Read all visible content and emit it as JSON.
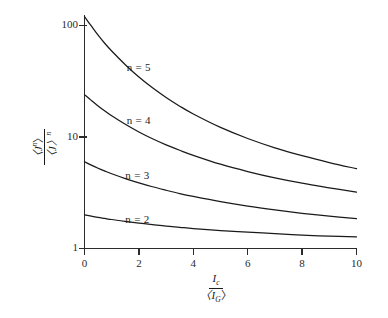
{
  "chart_data": {
    "type": "line",
    "title": "",
    "subtitle": "",
    "xlabel": "I_c / <I_G>",
    "ylabel": "<J^n> / <J>^n",
    "xlabel_parts": {
      "numerator": "I",
      "numerator_sub": "c",
      "denominator": "〈I",
      "denominator_sub": "G",
      "denominator_close": "〉"
    },
    "ylabel_parts": {
      "numerator": "〈J",
      "numerator_sup": "n",
      "numerator_close": "〉",
      "denominator": "〈J〉",
      "denominator_sup": "n"
    },
    "xscale": "linear",
    "yscale": "log",
    "xlim": [
      0,
      10
    ],
    "ylim": [
      1,
      140
    ],
    "grid": false,
    "legend": "inline-curve-labels",
    "xticks": [
      0,
      2,
      4,
      6,
      8,
      10
    ],
    "xtick_labels": [
      "0",
      "2",
      "4",
      "6",
      "8",
      "10"
    ],
    "yticks": [
      1,
      10,
      100
    ],
    "ytick_labels": [
      "1",
      "10",
      "100"
    ],
    "x": [
      0,
      0.25,
      0.5,
      0.75,
      1,
      1.5,
      2,
      2.5,
      3,
      3.5,
      4,
      5,
      6,
      7,
      8,
      9,
      10
    ],
    "series": [
      {
        "name": "n = 5",
        "label": "n = 5",
        "label_x": 1.55,
        "label_y": 42.0,
        "values": [
          120.0,
          99.0,
          82.0,
          69.0,
          59.0,
          44.5,
          34.5,
          27.6,
          22.6,
          18.9,
          16.1,
          12.2,
          9.7,
          8.0,
          6.8,
          5.9,
          5.2
        ]
      },
      {
        "name": "n = 4",
        "label": "n = 4",
        "label_x": 1.55,
        "label_y": 13.8,
        "values": [
          24.0,
          21.3,
          19.0,
          17.1,
          15.5,
          13.0,
          11.1,
          9.65,
          8.5,
          7.6,
          6.85,
          5.7,
          4.9,
          4.3,
          3.85,
          3.5,
          3.2
        ]
      },
      {
        "name": "n = 3",
        "label": "n = 3",
        "label_x": 1.5,
        "label_y": 4.45,
        "values": [
          6.0,
          5.6,
          5.25,
          4.95,
          4.68,
          4.24,
          3.88,
          3.58,
          3.33,
          3.11,
          2.93,
          2.63,
          2.4,
          2.22,
          2.07,
          1.95,
          1.85
        ]
      },
      {
        "name": "n = 2",
        "label": "n = 2",
        "label_x": 1.5,
        "label_y": 1.82,
        "values": [
          2.0,
          1.95,
          1.9,
          1.86,
          1.82,
          1.75,
          1.69,
          1.64,
          1.59,
          1.55,
          1.51,
          1.45,
          1.4,
          1.36,
          1.32,
          1.29,
          1.27
        ]
      }
    ]
  },
  "style": {
    "curve_color": "#1a1a1a",
    "axis_color": "#2b2b2b",
    "background": "#ffffff"
  }
}
